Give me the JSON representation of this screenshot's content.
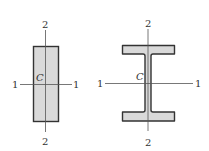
{
  "diagram": {
    "colors": {
      "fill": "#d9d9d9",
      "outline": "#333333",
      "axis": "#555555",
      "background": "#ffffff"
    },
    "figures": [
      {
        "name": "rectangular-section",
        "centroid_label": "C",
        "axis_1_labels": {
          "left": "1",
          "right": "1"
        },
        "axis_2_labels": {
          "top": "2",
          "bottom": "2"
        }
      },
      {
        "name": "i-beam-section",
        "centroid_label": "C",
        "axis_1_labels": {
          "left": "1",
          "right": "1"
        },
        "axis_2_labels": {
          "top": "2",
          "bottom": "2"
        }
      }
    ]
  }
}
